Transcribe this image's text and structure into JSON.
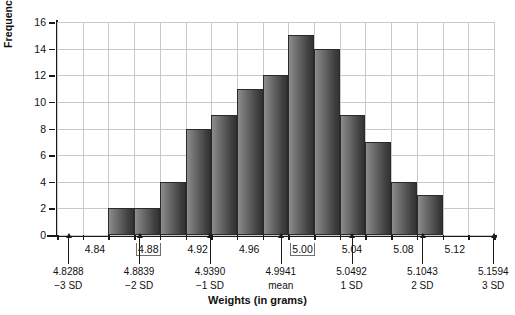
{
  "chart_data": {
    "type": "bar",
    "title": "",
    "xlabel": "Weights (in grams)",
    "ylabel": "Frequency",
    "ylim": [
      0,
      16
    ],
    "ytick_step": 2,
    "yticks": [
      "0",
      "2",
      "4",
      "6",
      "8",
      "10",
      "12",
      "14",
      "16"
    ],
    "grid": true,
    "legend": "none",
    "bin_width": 0.02,
    "bin_starts": [
      4.86,
      4.88,
      4.9,
      4.92,
      4.94,
      4.96,
      4.98,
      5.0,
      5.02,
      5.04,
      5.06,
      5.08,
      5.1
    ],
    "categories": [
      "4.86",
      "4.88",
      "4.90",
      "4.92",
      "4.94",
      "4.96",
      "4.98",
      "5.00",
      "5.02",
      "5.04",
      "5.06",
      "5.08",
      "5.10"
    ],
    "values": [
      2,
      2,
      4,
      8,
      9,
      11,
      12,
      15,
      14,
      9,
      7,
      4,
      3
    ],
    "xticks": [
      "4.84",
      "4.88",
      "4.92",
      "4.96",
      "5.00",
      "5.04",
      "5.08",
      "5.12"
    ],
    "xtick_values": [
      4.84,
      4.88,
      4.92,
      4.96,
      5.0,
      5.04,
      5.08,
      5.12
    ],
    "xlim": [
      4.82,
      5.16
    ],
    "annotations": [
      {
        "value": "4.8288",
        "tag": "−3 SD",
        "x": 4.8288
      },
      {
        "value": "4.8839",
        "tag": "−2 SD",
        "x": 4.8839
      },
      {
        "value": "4.9390",
        "tag": "−1 SD",
        "x": 4.939
      },
      {
        "value": "4.9941",
        "tag": "mean",
        "x": 4.9941
      },
      {
        "value": "5.0492",
        "tag": "1 SD",
        "x": 5.0492
      },
      {
        "value": "5.1043",
        "tag": "2 SD",
        "x": 5.1043
      },
      {
        "value": "5.1594",
        "tag": "3 SD",
        "x": 5.1594
      }
    ],
    "bar_color": "#5d5d5d",
    "grid_color": "#c9c9c9",
    "axis_color": "#1a1a1a"
  }
}
